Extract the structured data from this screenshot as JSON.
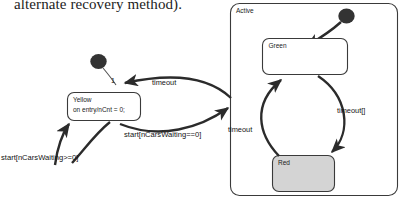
{
  "caption": {
    "text": "alternate recovery method)."
  },
  "diagram": {
    "colors": {
      "stroke": "#3a3a3a",
      "arrow": "#2b2b2b",
      "state_fill": "#ffffff",
      "red_state_fill": "#d4d4d4",
      "initial_fill": "#333333",
      "text": "#151515"
    },
    "composite_state": {
      "name": "Active"
    },
    "states": [
      {
        "id": "yellow",
        "name": "Yellow",
        "body": "on entry/nCnt  = 0;",
        "fill": "#ffffff"
      },
      {
        "id": "green",
        "name": "Green",
        "body": "",
        "fill": "#ffffff"
      },
      {
        "id": "red",
        "name": "Red",
        "body": "",
        "fill": "#d4d4d4"
      }
    ],
    "transitions": [
      {
        "id": "t-initial-yellow",
        "label": "1",
        "from": "initial-outer",
        "to": "yellow"
      },
      {
        "id": "t-active-yellow",
        "label": "timeout",
        "from": "Active",
        "to": "yellow"
      },
      {
        "id": "t-yellow-active",
        "label": "start[nCarsWaiting==0]",
        "from": "yellow",
        "to": "Active"
      },
      {
        "id": "t-yellow-self",
        "label": "start[nCarsWaiting>=0]",
        "from": "yellow",
        "to": "yellow"
      },
      {
        "id": "t-red-green",
        "label": "timeout",
        "from": "Red",
        "to": "Green"
      },
      {
        "id": "t-green-red",
        "label": "timeout[]",
        "from": "Green",
        "to": "Red"
      },
      {
        "id": "t-initial-green",
        "label": "",
        "from": "initial-inner",
        "to": "Green"
      }
    ]
  }
}
